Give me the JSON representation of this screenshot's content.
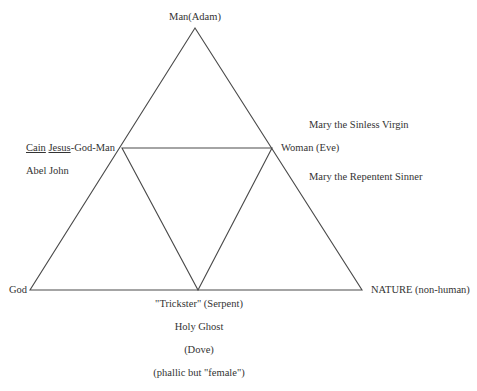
{
  "diagram": {
    "type": "nested-triangle",
    "outer_triangle": {
      "top": {
        "x": 195,
        "y": 28
      },
      "left": {
        "x": 30,
        "y": 290
      },
      "right": {
        "x": 362,
        "y": 290
      }
    },
    "inner_triangle": {
      "left": {
        "x": 122,
        "y": 148
      },
      "right": {
        "x": 272,
        "y": 148
      },
      "bottom": {
        "x": 198,
        "y": 290
      }
    },
    "line_color": "#4a4a4a"
  },
  "labels": {
    "top": "Man(Adam)",
    "left_mid_cain": "Cain",
    "left_mid_jesus": "Jesus",
    "left_mid_rest": "-God-Man",
    "left_mid_second": "Abel John",
    "right_mid": "Woman (Eve)",
    "right_upper": "Mary the Sinless Virgin",
    "right_lower": "Mary the Repentent Sinner",
    "bottom_left": "God",
    "bottom_right": "NATURE (non-human)",
    "bottom_center": [
      "\"Trickster\" (Serpent)",
      "Holy  Ghost",
      "(Dove)",
      "(phallic but \"female\")"
    ]
  }
}
